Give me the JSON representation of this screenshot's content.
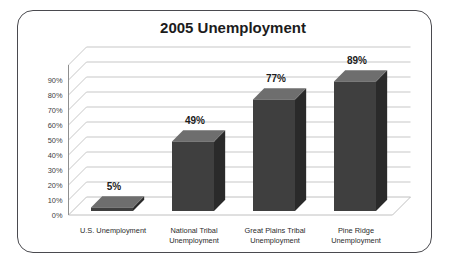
{
  "chart_data": {
    "type": "bar",
    "title": "2005 Unemployment",
    "xlabel": "",
    "ylabel": "",
    "ylim": [
      0,
      100
    ],
    "ytick_step": 10,
    "grid": true,
    "legend": "none",
    "style": "3d-column",
    "categories": [
      "U.S. Unemployment",
      "National Tribal Unemployment",
      "Great Plains Tribal Unemployment",
      "Pine Ridge Unemployment"
    ],
    "category_lines": [
      [
        "U.S. Unemployment"
      ],
      [
        "National Tribal",
        "Unemployment"
      ],
      [
        "Great Plains Tribal",
        "Unemployment"
      ],
      [
        "Pine Ridge",
        "Unemployment"
      ]
    ],
    "values": [
      5,
      49,
      77,
      89
    ],
    "data_labels": [
      "5%",
      "49%",
      "77%",
      "89%"
    ],
    "ytick_labels": [
      "0%",
      "10%",
      "20%",
      "30%",
      "40%",
      "50%",
      "60%",
      "70%",
      "80%",
      "90%"
    ],
    "ytick_values": [
      0,
      10,
      20,
      30,
      40,
      50,
      60,
      70,
      80,
      90
    ],
    "colors": {
      "bar_front": "#3f3f3f",
      "bar_top": "#6e6e6e",
      "bar_side": "#2a2a2a",
      "gridline": "#b9b9b9",
      "frame_border": "#4a4a4f",
      "background": "#ffffff",
      "title_text": "#1c1c1c"
    }
  }
}
